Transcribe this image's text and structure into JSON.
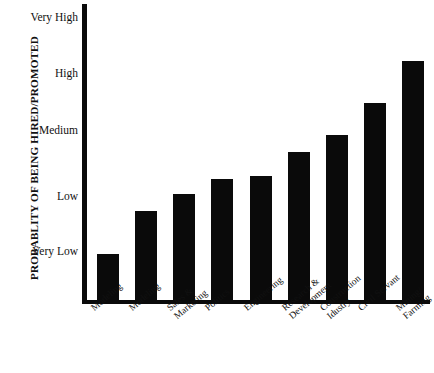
{
  "chart_data": {
    "type": "bar",
    "title": "",
    "xlabel": "",
    "ylabel": "PROBABLITY OF BEING HIRED/PROMOTED",
    "categories": [
      "Modeling",
      "Modeling",
      "Sales &\nMarketing",
      "Politics",
      "Engineering",
      "Research &\nDevelopment",
      "Construction\nIdustry",
      "Civil Servant",
      "Mining/\nFarming"
    ],
    "ytick_labels": [
      "Very Low",
      "Low",
      "Medium",
      "High",
      "Very High"
    ],
    "ytick_values": [
      1,
      2,
      3,
      4,
      5
    ],
    "ylim": [
      0.15,
      5.15
    ],
    "grid": false,
    "legend": false,
    "bar_color": "#0a0a0a",
    "bars": [
      {
        "label": "Modeling",
        "value": 0.93,
        "level": "Very Low"
      },
      {
        "label": "Modeling",
        "value": 1.65,
        "level": "Low"
      },
      {
        "label": "Sales &\nMarketing",
        "value": 1.94,
        "level": "Low"
      },
      {
        "label": "Politics",
        "value": 2.2,
        "level": "Low"
      },
      {
        "label": "Engineering",
        "value": 2.25,
        "level": "Low"
      },
      {
        "label": "Research &\nDevelopment",
        "value": 2.65,
        "level": "Medium"
      },
      {
        "label": "Construction\nIdustry",
        "value": 2.94,
        "level": "Medium"
      },
      {
        "label": "Civil Servant",
        "value": 3.47,
        "level": "High"
      },
      {
        "label": "Mining/\nFarming",
        "value": 4.18,
        "level": "Very High"
      }
    ],
    "values": [
      0.93,
      1.65,
      1.94,
      2.2,
      2.25,
      2.65,
      2.94,
      3.47,
      4.18
    ],
    "bar_pixel_tops": [
      255,
      213,
      196,
      181,
      178,
      155,
      138,
      107,
      66,
      24
    ]
  },
  "axis": {
    "y_title": "PROBABLITY OF BEING HIRED/PROMOTED",
    "y_ticks": [
      {
        "label": "Very High",
        "value": 5
      },
      {
        "label": "High",
        "value": 4
      },
      {
        "label": "Medium",
        "value": 3
      },
      {
        "label": "Low",
        "value": 2
      },
      {
        "label": "Very Low",
        "value": 1
      }
    ]
  },
  "colors": {
    "bar": "#0a0a0a",
    "axis": "#0a0a0a",
    "background": "#ffffff",
    "text": "#111111"
  }
}
